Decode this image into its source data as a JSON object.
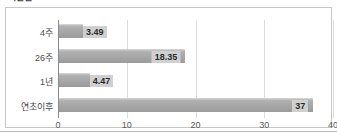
{
  "figure": {
    "clipped_title": "기간별",
    "frame_color": "#c6c6c6",
    "bar_color": "#a6a6a6",
    "label_box_color": "#d0d0d0",
    "grid_color": "#dcdcdc",
    "axis_color": "#8a8a8a"
  },
  "chart_data": {
    "type": "bar",
    "orientation": "horizontal",
    "title": "",
    "xlabel": "",
    "ylabel": "",
    "categories": [
      "4주",
      "26주",
      "1년",
      "연초이후"
    ],
    "values": [
      3.49,
      18.35,
      4.47,
      37
    ],
    "value_labels": [
      "3.49",
      "18.35",
      "4.47",
      "37"
    ],
    "xlim": [
      0,
      40
    ],
    "xticks": [
      0,
      10,
      20,
      30,
      40
    ],
    "xtick_labels": [
      "0",
      "10",
      "20",
      "30",
      "40"
    ],
    "grid": true,
    "grid_axis": "x",
    "legend": false,
    "series": [
      {
        "name": "",
        "values": [
          3.49,
          18.35,
          4.47,
          37
        ]
      }
    ]
  }
}
